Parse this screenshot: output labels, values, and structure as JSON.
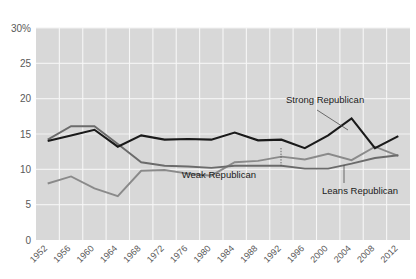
{
  "chart_data": {
    "type": "line",
    "title": "",
    "xlabel": "",
    "ylabel": "",
    "ylim": [
      0,
      30
    ],
    "yticks": [
      0,
      5,
      10,
      15,
      20,
      25,
      30
    ],
    "ytick_labels": [
      "0",
      "5",
      "10",
      "15",
      "20",
      "25",
      "30%"
    ],
    "grid": true,
    "legend_position": "inline-annotations",
    "categories": [
      "1952",
      "1956",
      "1960",
      "1964",
      "1968",
      "1972",
      "1976",
      "1980",
      "1984",
      "1988",
      "1992",
      "1996",
      "2000",
      "2004",
      "2008",
      "2012"
    ],
    "series": [
      {
        "name": "Strong Republican",
        "color": "#1a1a1a",
        "values": [
          14.0,
          14.8,
          15.6,
          13.2,
          14.8,
          14.2,
          14.3,
          14.2,
          15.2,
          14.1,
          14.2,
          13.0,
          14.8,
          17.2,
          13.0,
          14.7
        ]
      },
      {
        "name": "Weak Republican",
        "color": "#6b6b6b",
        "values": [
          14.2,
          16.1,
          16.1,
          13.6,
          11.0,
          10.5,
          10.4,
          10.2,
          10.5,
          10.5,
          10.5,
          10.1,
          10.1,
          10.8,
          11.6,
          12.0
        ]
      },
      {
        "name": "Leans Republican",
        "color": "#8a8a8a",
        "values": [
          8.0,
          9.0,
          7.3,
          6.2,
          9.8,
          9.9,
          9.4,
          9.1,
          11.0,
          11.2,
          11.8,
          11.4,
          12.2,
          11.3,
          13.2,
          11.9
        ]
      }
    ],
    "annotations": [
      {
        "label": "Strong Republican",
        "anchor_year": "2004",
        "anchor_value": 17.2
      },
      {
        "label": "Weak Republican",
        "anchor_year": "1996",
        "anchor_value": 10.1
      },
      {
        "label": "Leans Republican",
        "anchor_year": "2004",
        "anchor_value": 11.3
      }
    ]
  },
  "axes": {
    "y_axis_suffix": "%"
  }
}
